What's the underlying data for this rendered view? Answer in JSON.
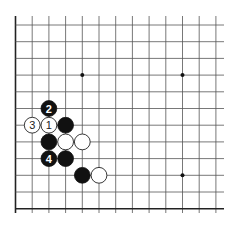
{
  "board": {
    "visible_columns": 13,
    "visible_rows": 12,
    "edges": [
      "left",
      "bottom"
    ],
    "star_points": [
      {
        "col": 3,
        "row": 3
      },
      {
        "col": 9,
        "row": 3
      },
      {
        "col": 9,
        "row": 9
      }
    ],
    "stones": [
      {
        "color": "black",
        "col": 2,
        "row": 5,
        "label": "2"
      },
      {
        "color": "white",
        "col": 1,
        "row": 6,
        "label": "3"
      },
      {
        "color": "white",
        "col": 2,
        "row": 6,
        "label": "1"
      },
      {
        "color": "black",
        "col": 3,
        "row": 6,
        "label": ""
      },
      {
        "color": "black",
        "col": 2,
        "row": 7,
        "label": ""
      },
      {
        "color": "white",
        "col": 3,
        "row": 7,
        "label": ""
      },
      {
        "color": "white",
        "col": 4,
        "row": 7,
        "label": ""
      },
      {
        "color": "black",
        "col": 2,
        "row": 8,
        "label": "4"
      },
      {
        "color": "black",
        "col": 3,
        "row": 8,
        "label": ""
      },
      {
        "color": "black",
        "col": 4,
        "row": 9,
        "label": ""
      },
      {
        "color": "white",
        "col": 5,
        "row": 9,
        "label": ""
      }
    ]
  }
}
